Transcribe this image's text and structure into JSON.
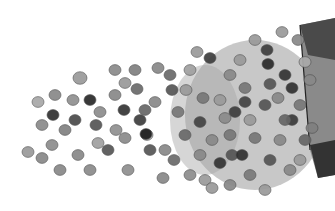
{
  "image": {
    "description": "Grayscale watercolor-style illustration of round seeds spilling out of a packet toward the left",
    "background": "#ffffff",
    "seed_fill_light": "#9a9a9a",
    "seed_fill_mid": "#7f7f7f",
    "seed_fill_dark": "#3a3a3a",
    "packet_color": "#555555"
  },
  "seeds": [
    [
      38,
      102,
      6,
      "#a8a8a8"
    ],
    [
      55,
      95,
      6,
      "#888"
    ],
    [
      53,
      115,
      6,
      "#2f2f2f"
    ],
    [
      42,
      125,
      6,
      "#8a8a8a"
    ],
    [
      28,
      152,
      6,
      "#999"
    ],
    [
      42,
      158,
      6,
      "#888"
    ],
    [
      52,
      145,
      6,
      "#8c8c8c"
    ],
    [
      65,
      130,
      6,
      "#808080"
    ],
    [
      75,
      120,
      6,
      "#4a4a4a"
    ],
    [
      73,
      100,
      6,
      "#909090"
    ],
    [
      80,
      78,
      7,
      "#9a9a9a"
    ],
    [
      90,
      100,
      6,
      "#2a2a2a"
    ],
    [
      96,
      125,
      6,
      "#555"
    ],
    [
      100,
      112,
      6,
      "#8d8d8d"
    ],
    [
      98,
      143,
      6,
      "#a0a0a0"
    ],
    [
      78,
      155,
      6,
      "#888"
    ],
    [
      108,
      150,
      6,
      "#555"
    ],
    [
      115,
      70,
      6,
      "#8a8a8a"
    ],
    [
      125,
      83,
      6,
      "#999"
    ],
    [
      135,
      70,
      6,
      "#7f7f7f"
    ],
    [
      137,
      89,
      6,
      "#6a6a6a"
    ],
    [
      124,
      110,
      6,
      "#333"
    ],
    [
      116,
      130,
      6,
      "#909090"
    ],
    [
      125,
      138,
      6,
      "#8a8a8a"
    ],
    [
      145,
      110,
      6,
      "#666"
    ],
    [
      140,
      120,
      6,
      "#3d3d3d"
    ],
    [
      147,
      135,
      6,
      "#aaa"
    ],
    [
      146,
      134,
      6,
      "#1f1f1f"
    ],
    [
      155,
      102,
      6,
      "#888"
    ],
    [
      158,
      68,
      6,
      "#888"
    ],
    [
      170,
      75,
      6,
      "#6a6a6a"
    ],
    [
      172,
      90,
      6,
      "#555"
    ],
    [
      178,
      112,
      6,
      "#777"
    ],
    [
      90,
      170,
      6,
      "#8a8a8a"
    ],
    [
      128,
      170,
      6,
      "#8f8f8f"
    ],
    [
      163,
      178,
      6,
      "#888"
    ],
    [
      197,
      52,
      6,
      "#999"
    ],
    [
      210,
      58,
      6,
      "#3d3d3d"
    ],
    [
      190,
      70,
      6,
      "#a0a0a0"
    ],
    [
      186,
      90,
      6,
      "#999"
    ],
    [
      203,
      98,
      6,
      "#777"
    ],
    [
      165,
      150,
      6,
      "#888"
    ],
    [
      174,
      160,
      6,
      "#6a6a6a"
    ],
    [
      190,
      175,
      6,
      "#8c8c8c"
    ],
    [
      205,
      180,
      6,
      "#999"
    ],
    [
      220,
      163,
      6,
      "#333"
    ],
    [
      232,
      155,
      6,
      "#555"
    ],
    [
      242,
      155,
      6,
      "#2f2f2f"
    ],
    [
      230,
      75,
      6,
      "#888"
    ],
    [
      240,
      60,
      6,
      "#9a9a9a"
    ],
    [
      255,
      40,
      6,
      "#999"
    ],
    [
      267,
      50,
      6,
      "#3d3d3d"
    ],
    [
      268,
      64,
      6,
      "#2a2a2a"
    ],
    [
      285,
      75,
      6,
      "#333"
    ],
    [
      292,
      88,
      6,
      "#2f2f2f"
    ],
    [
      270,
      84,
      6,
      "#555"
    ],
    [
      245,
      88,
      6,
      "#777"
    ],
    [
      245,
      102,
      6,
      "#444"
    ],
    [
      235,
      112,
      6,
      "#3d3d3d"
    ],
    [
      225,
      118,
      6,
      "#8a8a8a"
    ],
    [
      200,
      122,
      6,
      "#444"
    ],
    [
      212,
      140,
      6,
      "#888"
    ],
    [
      255,
      138,
      6,
      "#777"
    ],
    [
      265,
      105,
      6,
      "#555"
    ],
    [
      278,
      98,
      6,
      "#888"
    ],
    [
      292,
      120,
      6,
      "#3a3a3a"
    ],
    [
      300,
      105,
      6,
      "#777"
    ],
    [
      305,
      140,
      6,
      "#666"
    ],
    [
      270,
      160,
      6,
      "#555"
    ],
    [
      290,
      170,
      6,
      "#888"
    ],
    [
      265,
      190,
      6,
      "#999"
    ],
    [
      250,
      175,
      6,
      "#7a7a7a"
    ],
    [
      230,
      185,
      6,
      "#888"
    ],
    [
      212,
      188,
      6,
      "#999"
    ],
    [
      282,
      32,
      6,
      "#999"
    ],
    [
      298,
      40,
      6,
      "#888"
    ],
    [
      305,
      62,
      6,
      "#aaa"
    ],
    [
      310,
      80,
      6,
      "#888"
    ],
    [
      312,
      128,
      6,
      "#7f7f7f"
    ],
    [
      300,
      160,
      6,
      "#999"
    ],
    [
      60,
      170,
      6,
      "#888"
    ],
    [
      115,
      95,
      6,
      "#888"
    ],
    [
      150,
      150,
      6,
      "#555"
    ],
    [
      185,
      135,
      6,
      "#6a6a6a"
    ],
    [
      200,
      155,
      6,
      "#888"
    ],
    [
      220,
      100,
      6,
      "#999"
    ],
    [
      230,
      135,
      6,
      "#777"
    ],
    [
      250,
      120,
      6,
      "#999"
    ],
    [
      280,
      140,
      6,
      "#888"
    ],
    [
      285,
      120,
      6,
      "#666"
    ]
  ]
}
